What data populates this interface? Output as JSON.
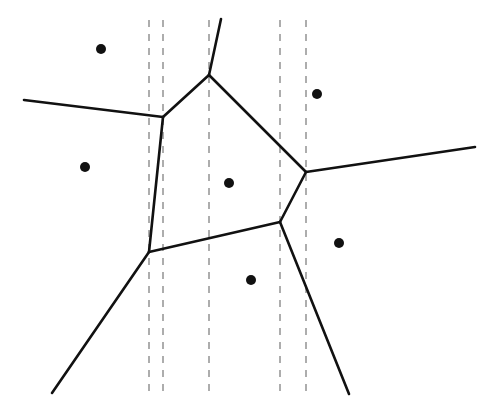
{
  "diagram": {
    "type": "voronoi",
    "width": 494,
    "height": 414,
    "colors": {
      "background": "#ffffff",
      "edge": "#111111",
      "site": "#111111",
      "sweep_line": "#777777"
    },
    "sites": [
      {
        "x": 101,
        "y": 49
      },
      {
        "x": 317,
        "y": 94
      },
      {
        "x": 85,
        "y": 167
      },
      {
        "x": 229,
        "y": 183
      },
      {
        "x": 339,
        "y": 243
      },
      {
        "x": 251,
        "y": 280
      }
    ],
    "vertices": {
      "top": {
        "x": 209,
        "y": 75
      },
      "upper_left": {
        "x": 163,
        "y": 117
      },
      "right": {
        "x": 306,
        "y": 172
      },
      "lower_right": {
        "x": 280,
        "y": 222
      },
      "lower_left": {
        "x": 149,
        "y": 252
      }
    },
    "edges": [
      {
        "x1": 221,
        "y1": 19,
        "x2": 209,
        "y2": 75
      },
      {
        "x1": 209,
        "y1": 75,
        "x2": 163,
        "y2": 117
      },
      {
        "x1": 209,
        "y1": 75,
        "x2": 306,
        "y2": 172
      },
      {
        "x1": 24,
        "y1": 100,
        "x2": 163,
        "y2": 117
      },
      {
        "x1": 163,
        "y1": 117,
        "x2": 149,
        "y2": 252
      },
      {
        "x1": 306,
        "y1": 172,
        "x2": 475,
        "y2": 147
      },
      {
        "x1": 306,
        "y1": 172,
        "x2": 280,
        "y2": 222
      },
      {
        "x1": 280,
        "y1": 222,
        "x2": 149,
        "y2": 252
      },
      {
        "x1": 149,
        "y1": 252,
        "x2": 52,
        "y2": 393
      },
      {
        "x1": 280,
        "y1": 222,
        "x2": 349,
        "y2": 394
      }
    ],
    "dashed_lines": [
      {
        "x": 149,
        "y1": 20,
        "y2": 394
      },
      {
        "x": 163,
        "y1": 20,
        "y2": 394
      },
      {
        "x": 209,
        "y1": 20,
        "y2": 394
      },
      {
        "x": 280,
        "y1": 20,
        "y2": 394
      },
      {
        "x": 306,
        "y1": 20,
        "y2": 394
      }
    ]
  }
}
